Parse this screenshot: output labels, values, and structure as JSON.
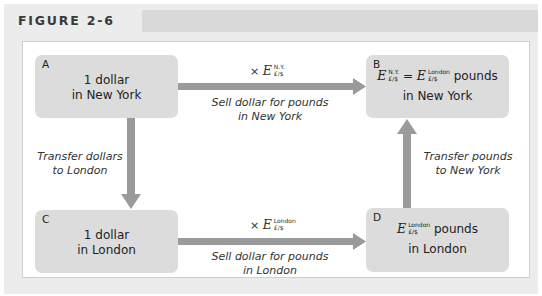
{
  "figure": {
    "title": "FIGURE 2-6"
  },
  "colors": {
    "frame": "#ececec",
    "title_band": "#d9d9d9",
    "box": "#dcdcdc",
    "arrow": "#9a9a9a",
    "panel": "#ffffff"
  },
  "boxes": {
    "a": {
      "letter": "A",
      "line1": "1 dollar",
      "line2": "in New York"
    },
    "b": {
      "letter": "B",
      "E": "E",
      "sup1": "N.Y.",
      "sub": "£/$",
      "equals": "=",
      "sup2": "London",
      "unit": "pounds",
      "line2": "in New York"
    },
    "c": {
      "letter": "C",
      "line1": "1 dollar",
      "line2": "in London"
    },
    "d": {
      "letter": "D",
      "E": "E",
      "sup": "London",
      "sub": "£/$",
      "unit": "pounds",
      "line2": "in London"
    }
  },
  "arrows": {
    "a_to_b": {
      "times": "×",
      "E": "E",
      "sup": "N.Y.",
      "sub": "£/$",
      "label1": "Sell dollar for pounds",
      "label2": "in New York"
    },
    "c_to_d": {
      "times": "×",
      "E": "E",
      "sup": "London",
      "sub": "£/$",
      "label1": "Sell dollar for pounds",
      "label2": "in London"
    },
    "a_to_c": {
      "label1": "Transfer dollars",
      "label2": "to London"
    },
    "d_to_b": {
      "label1": "Transfer pounds",
      "label2": "to New York"
    }
  }
}
